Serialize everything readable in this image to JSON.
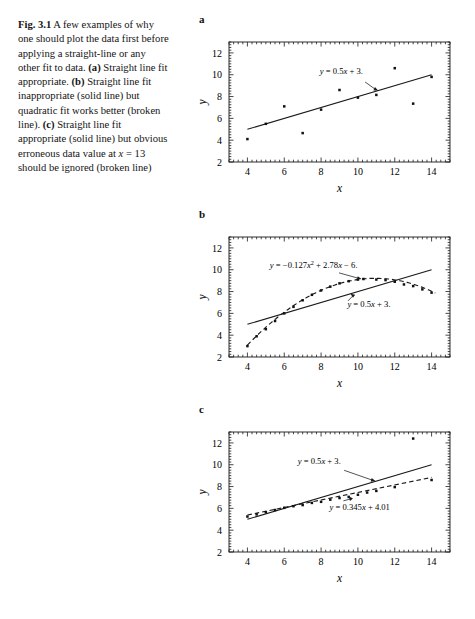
{
  "caption": {
    "fig_number": "Fig. 3.1",
    "text_parts": [
      {
        "type": "text",
        "value": " A few examples of why one should plot the data first before applying a straight-line or any other fit to data. "
      },
      {
        "type": "panel",
        "value": "(a)"
      },
      {
        "type": "text",
        "value": " Straight line fit appropriate. "
      },
      {
        "type": "panel",
        "value": "(b)"
      },
      {
        "type": "text",
        "value": " Straight line fit inappropriate (solid line) but quadratic fit works better (broken line). "
      },
      {
        "type": "panel",
        "value": "(c)"
      },
      {
        "type": "text",
        "value": " Straight line fit appropriate (solid line) but obvious erroneous data value at "
      },
      {
        "type": "italic",
        "value": "x"
      },
      {
        "type": "text",
        "value": " = 13 should be ignored (broken line)"
      }
    ],
    "full_text": "Fig. 3.1 A few examples of why one should plot the data first before applying a straight-line or any other fit to data. (a) Straight line fit appropriate. (b) Straight line fit inappropriate (solid line) but quadratic fit works better (broken line). (c) Straight line fit appropriate (solid line) but obvious erroneous data value at x = 13 should be ignored (broken line)"
  },
  "figure": {
    "panel_labels": [
      "a",
      "b",
      "c"
    ]
  },
  "chart_data": [
    {
      "id": "a",
      "panel_label": "a",
      "type": "scatter",
      "title": "",
      "xlabel": "x",
      "ylabel": "y",
      "xlim": [
        3,
        15
      ],
      "ylim": [
        2,
        13
      ],
      "xticks": [
        4,
        6,
        8,
        10,
        12,
        14
      ],
      "yticks": [
        2,
        4,
        6,
        8,
        10,
        12
      ],
      "grid": false,
      "legend": "none",
      "points": {
        "x": [
          4,
          5,
          6,
          7,
          8,
          9,
          10,
          11,
          12,
          13,
          14
        ],
        "y": [
          4.1,
          5.5,
          7.1,
          4.65,
          6.8,
          8.6,
          7.9,
          8.15,
          10.6,
          7.35,
          9.8
        ]
      },
      "fits": [
        {
          "name": "linear-fit",
          "style": "solid",
          "equation_text": "y = 0.5x + 3.",
          "slope": 0.5,
          "intercept": 3,
          "x_range": [
            4,
            14
          ],
          "label_x": 9.1,
          "label_y": 10.05,
          "arrow_to_x": 11.1,
          "arrow_to_y": 8.55
        }
      ]
    },
    {
      "id": "b",
      "panel_label": "b",
      "type": "scatter",
      "title": "",
      "xlabel": "x",
      "ylabel": "y",
      "xlim": [
        3,
        15
      ],
      "ylim": [
        2,
        13
      ],
      "xticks": [
        4,
        6,
        8,
        10,
        12,
        14
      ],
      "yticks": [
        2,
        4,
        6,
        8,
        10,
        12
      ],
      "grid": false,
      "legend": "none",
      "points": {
        "x": [
          4,
          4.5,
          5,
          5.5,
          6,
          6.5,
          7,
          7.5,
          8,
          8.5,
          9,
          9.5,
          10,
          10.3,
          11,
          11.5,
          12,
          12.5,
          13,
          13.5,
          14
        ],
        "y": [
          3.0,
          3.9,
          4.55,
          5.3,
          6.0,
          6.6,
          7.2,
          7.7,
          8.1,
          8.45,
          8.75,
          8.95,
          9.1,
          9.15,
          9.1,
          9.05,
          8.9,
          8.65,
          8.5,
          8.2,
          7.9
        ]
      },
      "fits": [
        {
          "name": "linear-fit",
          "style": "solid",
          "equation_text": "y = 0.5x + 3.",
          "slope": 0.5,
          "intercept": 3,
          "x_range": [
            4,
            14
          ],
          "label_x": 10.6,
          "label_y": 6.55,
          "arrow_to_x": 9.6,
          "arrow_to_y": 7.8
        },
        {
          "name": "quadratic-fit",
          "style": "dashed",
          "equation_text": "y = −0.127x² + 2.78x − 6.",
          "a": -0.127,
          "b": 2.78,
          "c": -6,
          "x_range": [
            4,
            14.2
          ],
          "label_x": 7.6,
          "label_y": 10.2,
          "arrow_to_x": 10.2,
          "arrow_to_y": 9.15
        }
      ]
    },
    {
      "id": "c",
      "panel_label": "c",
      "type": "scatter",
      "title": "",
      "xlabel": "x",
      "ylabel": "y",
      "xlim": [
        3,
        15
      ],
      "ylim": [
        2,
        13
      ],
      "xticks": [
        4,
        6,
        8,
        10,
        12,
        14
      ],
      "yticks": [
        2,
        4,
        6,
        8,
        10,
        12
      ],
      "grid": false,
      "legend": "none",
      "points": {
        "x": [
          4,
          4.5,
          5,
          5.5,
          6,
          6.5,
          7,
          7.5,
          8,
          8.5,
          9,
          9.5,
          10,
          10.5,
          11,
          12,
          13,
          14
        ],
        "y": [
          5.25,
          5.45,
          5.65,
          5.85,
          6.05,
          6.2,
          6.3,
          6.5,
          6.6,
          6.8,
          6.95,
          7.05,
          7.25,
          7.45,
          7.6,
          7.95,
          12.4,
          8.6
        ]
      },
      "outlier": {
        "x": 13,
        "y": 12.4
      },
      "fits": [
        {
          "name": "linear-fit-all",
          "style": "solid",
          "equation_text": "y = 0.5x + 3.",
          "slope": 0.5,
          "intercept": 3,
          "x_range": [
            4,
            14
          ],
          "label_x": 7.9,
          "label_y": 10.05,
          "arrow_to_x": 10.95,
          "arrow_to_y": 8.5
        },
        {
          "name": "linear-fit-excluding-outlier",
          "style": "dashed",
          "equation_text": "y = 0.345x + 4.01",
          "slope": 0.345,
          "intercept": 4.01,
          "x_range": [
            4,
            14
          ],
          "label_x": 10.1,
          "label_y": 5.85,
          "arrow_to_x": 9.5,
          "arrow_to_y": 7.1
        }
      ]
    }
  ]
}
